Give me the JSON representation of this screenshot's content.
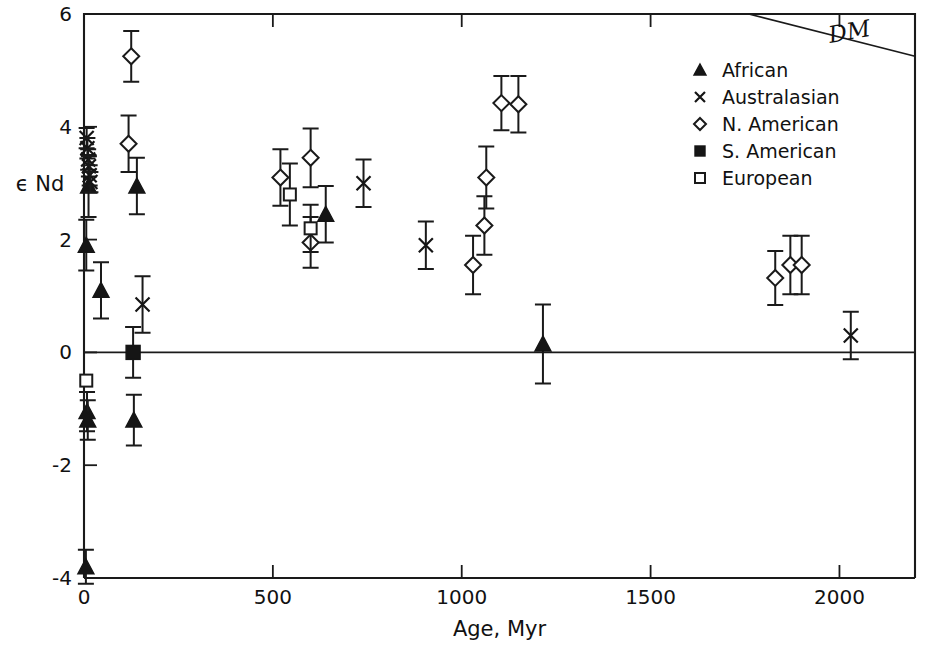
{
  "chart_data": {
    "type": "scatter",
    "title": "",
    "xlabel": "Age, Myr",
    "ylabel": "ϵ Nd",
    "xlim": [
      0,
      2200
    ],
    "ylim": [
      -4,
      6
    ],
    "xticks": [
      0,
      500,
      1000,
      1500,
      2000
    ],
    "xticklabels": [
      "0",
      "500",
      "1000",
      "1500",
      "2000"
    ],
    "yticks": [
      -4,
      -2,
      0,
      2,
      4,
      6
    ],
    "yticklabels": [
      "-4",
      "-2",
      "0",
      "2",
      "4",
      "6"
    ],
    "grid": false,
    "legend_position": "top-right",
    "annotations": [
      {
        "text": "DM",
        "meaning": "depleted-mantle-evolution-line",
        "x": 2030,
        "y": 5.55
      }
    ],
    "reference_lines": [
      {
        "name": "zero-line",
        "orientation": "horizontal",
        "value": 0
      },
      {
        "name": "dm-line",
        "orientation": "diagonal",
        "from": [
          1760,
          6.0
        ],
        "to": [
          2200,
          5.25
        ]
      }
    ],
    "series": [
      {
        "name": "African",
        "marker": "filled-triangle",
        "points": [
          {
            "x": 5,
            "y": -3.8,
            "yerr_low": 0.3,
            "yerr_high": 0.3
          },
          {
            "x": 8,
            "y": -1.05,
            "yerr_low": 0.35,
            "yerr_high": 0.35
          },
          {
            "x": 10,
            "y": -1.2,
            "yerr_low": 0.35,
            "yerr_high": 0.35
          },
          {
            "x": 6,
            "y": 1.9,
            "yerr_low": 0.45,
            "yerr_high": 0.45
          },
          {
            "x": 12,
            "y": 2.95,
            "yerr_low": 0.55,
            "yerr_high": 0.55
          },
          {
            "x": 45,
            "y": 1.1,
            "yerr_low": 0.5,
            "yerr_high": 0.5
          },
          {
            "x": 132,
            "y": -1.2,
            "yerr_low": 0.45,
            "yerr_high": 0.45
          },
          {
            "x": 140,
            "y": 2.95,
            "yerr_low": 0.5,
            "yerr_high": 0.5
          },
          {
            "x": 640,
            "y": 2.45,
            "yerr_low": 0.5,
            "yerr_high": 0.5
          },
          {
            "x": 1215,
            "y": 0.15,
            "yerr_low": 0.7,
            "yerr_high": 0.7
          }
        ]
      },
      {
        "name": "Australasian",
        "marker": "cross",
        "points": [
          {
            "x": 7,
            "y": 3.8,
            "yerr_low": 0.18,
            "yerr_high": 0.18
          },
          {
            "x": 9,
            "y": 3.62,
            "yerr_low": 0.18,
            "yerr_high": 0.18
          },
          {
            "x": 11,
            "y": 3.42,
            "yerr_low": 0.18,
            "yerr_high": 0.18
          },
          {
            "x": 13,
            "y": 3.3,
            "yerr_low": 0.18,
            "yerr_high": 0.18
          },
          {
            "x": 15,
            "y": 3.14,
            "yerr_low": 0.18,
            "yerr_high": 0.18
          },
          {
            "x": 17,
            "y": 3.02,
            "yerr_low": 0.18,
            "yerr_high": 0.18
          },
          {
            "x": 155,
            "y": 0.85,
            "yerr_low": 0.5,
            "yerr_high": 0.5
          },
          {
            "x": 740,
            "y": 3.0,
            "yerr_low": 0.42,
            "yerr_high": 0.42
          },
          {
            "x": 905,
            "y": 1.9,
            "yerr_low": 0.42,
            "yerr_high": 0.42
          },
          {
            "x": 2030,
            "y": 0.3,
            "yerr_low": 0.42,
            "yerr_high": 0.42
          }
        ]
      },
      {
        "name": "N. American",
        "marker": "open-diamond",
        "points": [
          {
            "x": 125,
            "y": 5.25,
            "yerr_low": 0.45,
            "yerr_high": 0.45
          },
          {
            "x": 118,
            "y": 3.7,
            "yerr_low": 0.5,
            "yerr_high": 0.5
          },
          {
            "x": 520,
            "y": 3.1,
            "yerr_low": 0.5,
            "yerr_high": 0.5
          },
          {
            "x": 600,
            "y": 3.45,
            "yerr_low": 0.52,
            "yerr_high": 0.52
          },
          {
            "x": 600,
            "y": 1.95,
            "yerr_low": 0.45,
            "yerr_high": 0.45
          },
          {
            "x": 1030,
            "y": 1.55,
            "yerr_low": 0.52,
            "yerr_high": 0.52
          },
          {
            "x": 1060,
            "y": 2.25,
            "yerr_low": 0.52,
            "yerr_high": 0.52
          },
          {
            "x": 1065,
            "y": 3.1,
            "yerr_low": 0.55,
            "yerr_high": 0.55
          },
          {
            "x": 1105,
            "y": 4.42,
            "yerr_low": 0.48,
            "yerr_high": 0.48
          },
          {
            "x": 1150,
            "y": 4.4,
            "yerr_low": 0.5,
            "yerr_high": 0.5
          },
          {
            "x": 1830,
            "y": 1.32,
            "yerr_low": 0.48,
            "yerr_high": 0.48
          },
          {
            "x": 1870,
            "y": 1.55,
            "yerr_low": 0.52,
            "yerr_high": 0.52
          },
          {
            "x": 1900,
            "y": 1.55,
            "yerr_low": 0.52,
            "yerr_high": 0.52
          }
        ]
      },
      {
        "name": "S. American",
        "marker": "filled-square",
        "points": [
          {
            "x": 130,
            "y": 0.0,
            "yerr_low": 0.45,
            "yerr_high": 0.45
          }
        ]
      },
      {
        "name": "European",
        "marker": "open-square",
        "points": [
          {
            "x": 6,
            "y": -0.5,
            "yerr_low": 0.0,
            "yerr_high": 0.0
          },
          {
            "x": 545,
            "y": 2.8,
            "yerr_low": 0.55,
            "yerr_high": 0.55
          },
          {
            "x": 600,
            "y": 2.2,
            "yerr_low": 0.42,
            "yerr_high": 0.42
          }
        ]
      }
    ]
  },
  "legend": {
    "entries": [
      {
        "label": "African",
        "marker": "filled-triangle"
      },
      {
        "label": "Australasian",
        "marker": "cross"
      },
      {
        "label": "N. American",
        "marker": "open-diamond"
      },
      {
        "label": "S. American",
        "marker": "filled-square"
      },
      {
        "label": "European",
        "marker": "open-square"
      }
    ]
  },
  "colors": {
    "ink": "#151515",
    "background": "#ffffff"
  }
}
